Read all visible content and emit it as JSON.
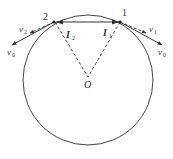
{
  "diagram": {
    "type": "physics-circular-motion",
    "circle": {
      "cx": 88,
      "cy": 80,
      "r": 65,
      "color": "#444444"
    },
    "center": {
      "label": "O",
      "x": 88,
      "y": 77
    },
    "points": [
      {
        "id": "1",
        "label": "1",
        "x": 120,
        "y": 21
      },
      {
        "id": "2",
        "label": "2",
        "x": 54,
        "y": 22
      }
    ],
    "impulses": [
      {
        "label": "I",
        "subscript": "1",
        "near": "1"
      },
      {
        "label": "I",
        "subscript": "2",
        "near": "2"
      }
    ],
    "velocities": [
      {
        "label": "v",
        "subscript": "1",
        "style": "dashed",
        "at": "1"
      },
      {
        "label": "v",
        "subscript": "0",
        "style": "solid",
        "at": "1"
      },
      {
        "label": "v",
        "subscript": "2",
        "style": "dashed",
        "at": "2"
      },
      {
        "label": "v",
        "subscript": "0",
        "style": "solid",
        "at": "2"
      }
    ]
  },
  "labels": {
    "point1": "1",
    "point2": "2",
    "center": "O",
    "I": "I",
    "I1_sub": "1",
    "I2_sub": "2",
    "v": "v",
    "v1_sub": "1",
    "v2_sub": "2",
    "v0_sub": "0"
  }
}
